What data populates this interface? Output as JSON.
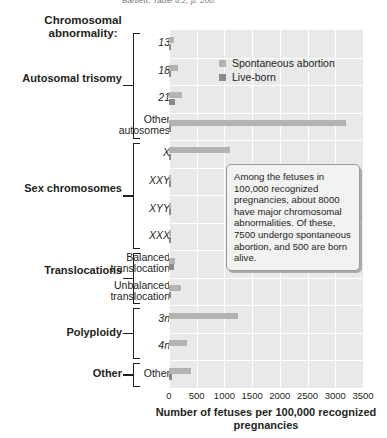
{
  "citation": "Bartlett, Table 6.2, p. 200.",
  "axis_caption": "Chromosomal abnormality:",
  "legend": {
    "items": [
      {
        "label": "Spontaneous abortion",
        "color": "#b3b3b3"
      },
      {
        "label": "Live-born",
        "color": "#8a8a8a"
      }
    ]
  },
  "callout": {
    "text": "Among the fetuses in 100,000 recognized pregnancies, about 8000 have major chromosomal abnormalities. Of these, 7500 undergo spontaneous abortion, and 500 are born alive."
  },
  "groups": [
    {
      "label": "Autosomal trisomy",
      "start": 0,
      "end": 3
    },
    {
      "label": "Sex chromosomes",
      "start": 4,
      "end": 7
    },
    {
      "label": "Translocations",
      "start": 8,
      "end": 9
    },
    {
      "label": "Polyploidy",
      "start": 10,
      "end": 11
    },
    {
      "label": "Other",
      "start": 12,
      "end": 12
    }
  ],
  "chart_data": {
    "type": "bar",
    "orientation": "horizontal",
    "title": "",
    "xlabel": "Number of fetuses per 100,000 recognized pregnancies",
    "ylabel": "Chromosomal abnormality:",
    "xlim": [
      0,
      3500
    ],
    "xticks": [
      0,
      500,
      1000,
      1500,
      2000,
      2500,
      3000,
      3500
    ],
    "grid": true,
    "legend_position": "inside-top-right",
    "categories": [
      "13",
      "18",
      "21",
      "Other autosomes",
      "X",
      "XXY",
      "XYY",
      "XXX",
      "Balanced translocation",
      "Unbalanced translocation",
      "3n",
      "4n",
      "Other"
    ],
    "categories_italic": [
      true,
      true,
      true,
      false,
      true,
      true,
      true,
      true,
      false,
      false,
      true,
      true,
      false
    ],
    "series": [
      {
        "name": "Spontaneous abortion",
        "color": "#b3b3b3",
        "values": [
          95,
          170,
          240,
          3200,
          1100,
          10,
          5,
          5,
          110,
          210,
          1250,
          330,
          400
        ]
      },
      {
        "name": "Live-born",
        "color": "#8a8a8a",
        "values": [
          20,
          20,
          100,
          25,
          10,
          40,
          40,
          40,
          95,
          20,
          0,
          0,
          50
        ]
      }
    ]
  }
}
